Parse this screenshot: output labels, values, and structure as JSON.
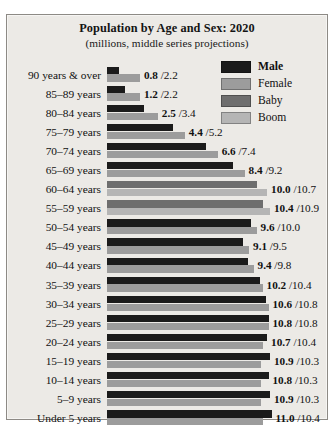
{
  "chart_data": {
    "type": "bar",
    "title": "Population by Age and Sex: 2020",
    "subtitle": "(millions, middle series projections)",
    "orientation": "horizontal",
    "xlabel": "",
    "ylabel": "",
    "grid": false,
    "legend_position": "top-right",
    "legend": [
      {
        "label": "Male",
        "color": "#1b1b1b",
        "bold": true
      },
      {
        "label": "Female",
        "color": "#9c9c9c",
        "bold": false
      },
      {
        "label": "Baby",
        "color": "#6e6e6e",
        "bold": false
      },
      {
        "label": "Boom",
        "color": "#b5b5b5",
        "bold": false
      }
    ],
    "series": [
      {
        "name": "Male",
        "values": [
          0.8,
          1.2,
          2.5,
          4.4,
          6.6,
          8.4,
          10.0,
          10.4,
          9.6,
          9.1,
          9.4,
          10.2,
          10.6,
          10.8,
          10.7,
          10.9,
          10.8,
          10.9,
          11.0
        ]
      },
      {
        "name": "Female",
        "values": [
          2.2,
          2.2,
          3.4,
          5.2,
          7.4,
          9.2,
          10.7,
          10.9,
          10.0,
          9.5,
          9.8,
          10.4,
          10.8,
          10.8,
          10.4,
          10.3,
          10.3,
          10.3,
          10.4
        ]
      }
    ],
    "categories": [
      "90 years & over",
      "85–89 years",
      "80–84 years",
      "75–79 years",
      "70–74 years",
      "65–69 years",
      "60–64 years",
      "55–59 years",
      "50–54 years",
      "45–49 years",
      "40–44 years",
      "35–39 years",
      "30–34 years",
      "25–29 years",
      "20–24 years",
      "15–19 years",
      "10–14 years",
      "5–9 years",
      "Under 5 years"
    ],
    "xlim": [
      0,
      11.5
    ],
    "rows": [
      {
        "age": "90 years & over",
        "male": 0.8,
        "female": 2.2,
        "label": "0.8 / 2.2",
        "male_text": "0.8",
        "female_text": "2.2",
        "baby_boom": false
      },
      {
        "age": "85–89 years",
        "male": 1.2,
        "female": 2.2,
        "label": "1.2 / 2.2",
        "male_text": "1.2",
        "female_text": "2.2",
        "baby_boom": false
      },
      {
        "age": "80–84 years",
        "male": 2.5,
        "female": 3.4,
        "label": "2.5 / 3.4",
        "male_text": "2.5",
        "female_text": "3.4",
        "baby_boom": false
      },
      {
        "age": "75–79 years",
        "male": 4.4,
        "female": 5.2,
        "label": "4.4 / 5.2",
        "male_text": "4.4",
        "female_text": "5.2",
        "baby_boom": false
      },
      {
        "age": "70–74 years",
        "male": 6.6,
        "female": 7.4,
        "label": "6.6 / 7.4",
        "male_text": "6.6",
        "female_text": "7.4",
        "baby_boom": false
      },
      {
        "age": "65–69 years",
        "male": 8.4,
        "female": 9.2,
        "label": "8.4 / 9.2",
        "male_text": "8.4",
        "female_text": "9.2",
        "baby_boom": false
      },
      {
        "age": "60–64 years",
        "male": 10.0,
        "female": 10.7,
        "label": "10.0 / 10.7",
        "male_text": "10.0",
        "female_text": "10.7",
        "baby_boom": true
      },
      {
        "age": "55–59 years",
        "male": 10.4,
        "female": 10.9,
        "label": "10.4 / 10.9",
        "male_text": "10.4",
        "female_text": "10.9",
        "baby_boom": true
      },
      {
        "age": "50–54 years",
        "male": 9.6,
        "female": 10.0,
        "label": "9.6 / 10.0",
        "male_text": "9.6",
        "female_text": "10.0",
        "baby_boom": false
      },
      {
        "age": "45–49 years",
        "male": 9.1,
        "female": 9.5,
        "label": "9.1 / 9.5",
        "male_text": "9.1",
        "female_text": "9.5",
        "baby_boom": false
      },
      {
        "age": "40–44 years",
        "male": 9.4,
        "female": 9.8,
        "label": "9.4 / 9.8",
        "male_text": "9.4",
        "female_text": "9.8",
        "baby_boom": false
      },
      {
        "age": "35–39 years",
        "male": 10.2,
        "female": 10.4,
        "label": "10.2 / 10.4",
        "male_text": "10.2",
        "female_text": "10.4",
        "baby_boom": false
      },
      {
        "age": "30–34 years",
        "male": 10.6,
        "female": 10.8,
        "label": "10.6 / 10.8",
        "male_text": "10.6",
        "female_text": "10.8",
        "baby_boom": false
      },
      {
        "age": "25–29 years",
        "male": 10.8,
        "female": 10.8,
        "label": "10.8 / 10.8",
        "male_text": "10.8",
        "female_text": "10.8",
        "baby_boom": false
      },
      {
        "age": "20–24 years",
        "male": 10.7,
        "female": 10.4,
        "label": "10.7 / 10.4",
        "male_text": "10.7",
        "female_text": "10.4",
        "baby_boom": false
      },
      {
        "age": "15–19 years",
        "male": 10.9,
        "female": 10.3,
        "label": "10.9 / 10.3",
        "male_text": "10.9",
        "female_text": "10.3",
        "baby_boom": false
      },
      {
        "age": "10–14 years",
        "male": 10.8,
        "female": 10.3,
        "label": "10.8 / 10.3",
        "male_text": "10.8",
        "female_text": "10.3",
        "baby_boom": false
      },
      {
        "age": "5–9 years",
        "male": 10.9,
        "female": 10.3,
        "label": "10.9 / 10.3",
        "male_text": "10.9",
        "female_text": "10.3",
        "baby_boom": false
      },
      {
        "age": "Under 5 years",
        "male": 11.0,
        "female": 10.4,
        "label": "11.0 / 10.4",
        "male_text": "11.0",
        "female_text": "10.4",
        "baby_boom": false
      }
    ],
    "colors": {
      "male": "#1b1b1b",
      "female": "#9c9c9c",
      "baby_boom_male": "#6e6e6e",
      "baby_boom_female": "#b5b5b5",
      "background": "#eceae6",
      "border": "#8d8a85",
      "text": "#111111"
    }
  }
}
